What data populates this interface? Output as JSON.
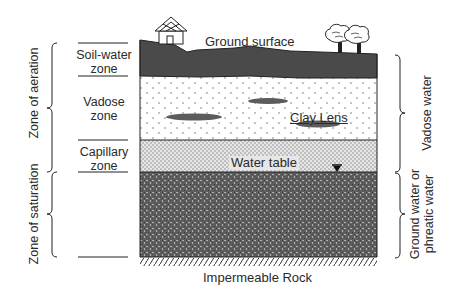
{
  "diagram": {
    "title_labels": {
      "ground_surface": "Ground surface",
      "clay_lens": "Clay Lens",
      "water_table": "Water table",
      "impermeable_rock": "Impermeable Rock"
    },
    "left_zones": [
      {
        "id": "soil-water",
        "line1": "Soil-water",
        "line2": "zone"
      },
      {
        "id": "vadose",
        "line1": "Vadose",
        "line2": "zone"
      },
      {
        "id": "capillary",
        "line1": "Capillary",
        "line2": "zone"
      }
    ],
    "left_brackets": {
      "aeration": "Zone of aeration",
      "saturation": "Zone of saturation"
    },
    "right_brackets": {
      "vadose_water": "Vadose water",
      "ground_water_line1": "Ground water or",
      "ground_water_line2": "phreatic water"
    },
    "icons": [
      "house-icon",
      "tree-icon",
      "tree-icon",
      "water-table-marker-icon"
    ],
    "colors": {
      "soil": "#4a4a4a",
      "saturated": "#5a5a5a",
      "capillary": "#d8d8d8",
      "vadose": "#ffffff",
      "clay": "#666666",
      "line": "#222222"
    }
  }
}
